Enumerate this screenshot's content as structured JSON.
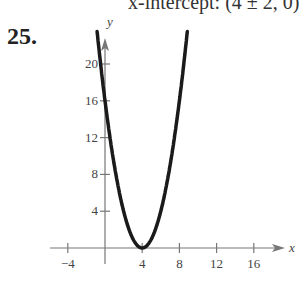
{
  "header": {
    "text": "x-intercept: (4 ± 2, 0)"
  },
  "problem_number": "25.",
  "chart_data": {
    "type": "line",
    "title": "",
    "function": "y = (x - 4)^2",
    "xlabel": "x",
    "ylabel": "y",
    "x_ticks": [
      -4,
      4,
      8,
      12,
      16
    ],
    "y_ticks": [
      4,
      8,
      12,
      16,
      20
    ],
    "x_tick_labels": [
      "-4",
      "4",
      "8",
      "12",
      "16"
    ],
    "y_tick_labels": [
      "4",
      "8",
      "12",
      "16",
      "20"
    ],
    "xlim": [
      -6,
      19
    ],
    "ylim": [
      0,
      22
    ],
    "grid": false,
    "series": [
      {
        "name": "parabola",
        "x": [
          -0.8,
          0,
          1,
          2,
          3,
          4,
          5,
          6,
          7,
          8,
          8.8
        ],
        "y": [
          23.04,
          16,
          9,
          4,
          1,
          0,
          1,
          4,
          9,
          16,
          23.04
        ]
      }
    ],
    "vertex": [
      4,
      0
    ]
  }
}
